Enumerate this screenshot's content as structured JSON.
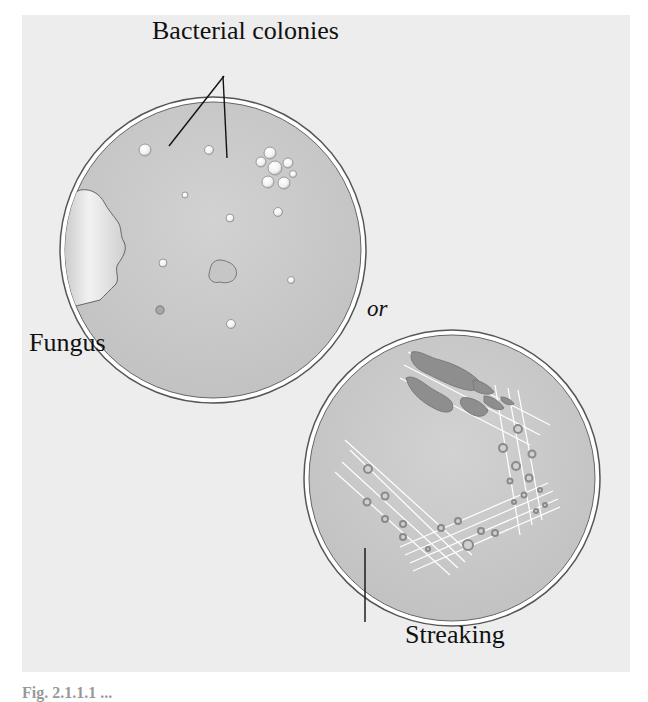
{
  "figure": {
    "labels": {
      "bacterial_colonies": "Bacterial colonies",
      "fungus": "Fungus",
      "or": "or",
      "streaking": "Streaking"
    },
    "caption_partial": "Fig. 2.1.1.1 ...",
    "colors": {
      "panel_bg": "#ededed",
      "plate_fill": "#c9c9c9",
      "plate_rim": "#ffffff",
      "plate_outline": "#555555",
      "colony_dark": "#8a8a8a"
    },
    "plates": [
      {
        "name": "contaminated-plate",
        "contains": [
          "bacterial colonies",
          "fungus"
        ]
      },
      {
        "name": "streaked-plate",
        "contains": [
          "streak lines",
          "isolated colonies"
        ]
      }
    ]
  }
}
